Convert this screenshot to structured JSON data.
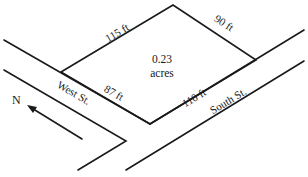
{
  "diagram": {
    "type": "lot-plat-map",
    "lot": {
      "area_value": "0.23",
      "area_unit": "acres",
      "sides": {
        "northwest": "115 ft",
        "northeast": "90 ft",
        "southwest": "87 ft",
        "southeast": "110 ft"
      }
    },
    "streets": {
      "west": "West St.",
      "south": "South St."
    },
    "compass": {
      "label": "N"
    },
    "colors": {
      "line": "#1a1a1a",
      "background": "#ffffff"
    }
  }
}
